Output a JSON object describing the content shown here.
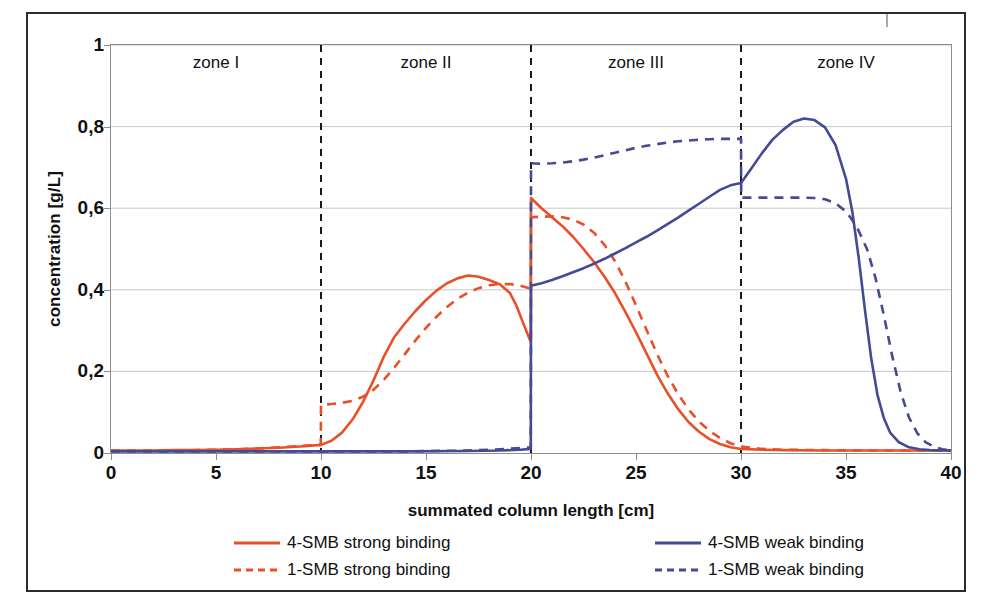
{
  "chart_data": {
    "type": "line",
    "title": "",
    "xlabel": "summated column length [cm]",
    "ylabel": "concentration [g/L]",
    "xlim": [
      0,
      40
    ],
    "ylim": [
      0,
      1
    ],
    "xticks": [
      "0",
      "5",
      "10",
      "15",
      "20",
      "25",
      "30",
      "35",
      "40"
    ],
    "xtick_values": [
      0,
      5,
      10,
      15,
      20,
      25,
      30,
      35,
      40
    ],
    "yticks": [
      "0",
      "0,2",
      "0,4",
      "0,6",
      "0,8",
      "1"
    ],
    "ytick_values": [
      0,
      0.2,
      0.4,
      0.6,
      0.8,
      1
    ],
    "grid": "horizontal",
    "legend_position": "below-axis",
    "zone_dividers": [
      10,
      20,
      30
    ],
    "zones": [
      {
        "label": "zone I",
        "start": 0,
        "end": 10
      },
      {
        "label": "zone II",
        "start": 10,
        "end": 20
      },
      {
        "label": "zone III",
        "start": 20,
        "end": 30
      },
      {
        "label": "zone IV",
        "start": 30,
        "end": 40
      }
    ],
    "colors": {
      "strong_binding": "#E8502A",
      "weak_binding": "#454A95",
      "zone_divider": "#1a1a1a",
      "grid": "#c9c9c9",
      "axis": "#8e8e8e",
      "frame": "#2b2b2b"
    },
    "series": [
      {
        "name": "4-SMB strong binding",
        "color": "#E8502A",
        "style": "solid",
        "points": [
          [
            0,
            0.006
          ],
          [
            1,
            0.006
          ],
          [
            2,
            0.006
          ],
          [
            3,
            0.007
          ],
          [
            4,
            0.007
          ],
          [
            5,
            0.008
          ],
          [
            6,
            0.009
          ],
          [
            7,
            0.011
          ],
          [
            8,
            0.013
          ],
          [
            9,
            0.016
          ],
          [
            9.99,
            0.02
          ],
          [
            10,
            0.02
          ],
          [
            10.5,
            0.03
          ],
          [
            11,
            0.05
          ],
          [
            11.5,
            0.082
          ],
          [
            12,
            0.125
          ],
          [
            12.5,
            0.178
          ],
          [
            13,
            0.237
          ],
          [
            13.5,
            0.285
          ],
          [
            14,
            0.318
          ],
          [
            14.5,
            0.348
          ],
          [
            15,
            0.375
          ],
          [
            15.5,
            0.398
          ],
          [
            16,
            0.416
          ],
          [
            16.5,
            0.428
          ],
          [
            17,
            0.435
          ],
          [
            17.5,
            0.432
          ],
          [
            18,
            0.424
          ],
          [
            18.5,
            0.414
          ],
          [
            19,
            0.392
          ],
          [
            19.3,
            0.362
          ],
          [
            19.6,
            0.322
          ],
          [
            19.85,
            0.29
          ],
          [
            19.99,
            0.272
          ],
          [
            20,
            0.625
          ],
          [
            20.5,
            0.6
          ],
          [
            21,
            0.578
          ],
          [
            21.5,
            0.556
          ],
          [
            22,
            0.53
          ],
          [
            22.5,
            0.5
          ],
          [
            23,
            0.468
          ],
          [
            23.5,
            0.432
          ],
          [
            24,
            0.392
          ],
          [
            24.5,
            0.345
          ],
          [
            25,
            0.296
          ],
          [
            25.5,
            0.244
          ],
          [
            26,
            0.192
          ],
          [
            26.5,
            0.147
          ],
          [
            27,
            0.108
          ],
          [
            27.5,
            0.076
          ],
          [
            28,
            0.052
          ],
          [
            28.5,
            0.034
          ],
          [
            29,
            0.022
          ],
          [
            29.5,
            0.014
          ],
          [
            30,
            0.01
          ],
          [
            31,
            0.008
          ],
          [
            32,
            0.007
          ],
          [
            34,
            0.006
          ],
          [
            36,
            0.006
          ],
          [
            38,
            0.006
          ],
          [
            40,
            0.006
          ]
        ]
      },
      {
        "name": "1-SMB strong binding",
        "color": "#E8502A",
        "style": "dashed",
        "points": [
          [
            0,
            0.006
          ],
          [
            2,
            0.006
          ],
          [
            4,
            0.007
          ],
          [
            6,
            0.009
          ],
          [
            7,
            0.011
          ],
          [
            8,
            0.014
          ],
          [
            9,
            0.017
          ],
          [
            9.99,
            0.02
          ],
          [
            10,
            0.118
          ],
          [
            10.5,
            0.12
          ],
          [
            11,
            0.123
          ],
          [
            11.5,
            0.128
          ],
          [
            12,
            0.138
          ],
          [
            12.5,
            0.155
          ],
          [
            13,
            0.18
          ],
          [
            13.5,
            0.21
          ],
          [
            14,
            0.243
          ],
          [
            14.5,
            0.276
          ],
          [
            15,
            0.307
          ],
          [
            15.5,
            0.334
          ],
          [
            16,
            0.358
          ],
          [
            16.5,
            0.378
          ],
          [
            17,
            0.393
          ],
          [
            17.5,
            0.404
          ],
          [
            18,
            0.411
          ],
          [
            18.5,
            0.414
          ],
          [
            19,
            0.414
          ],
          [
            19.5,
            0.41
          ],
          [
            19.99,
            0.403
          ],
          [
            20,
            0.578
          ],
          [
            20.5,
            0.579
          ],
          [
            21,
            0.58
          ],
          [
            21.5,
            0.578
          ],
          [
            22,
            0.572
          ],
          [
            22.5,
            0.56
          ],
          [
            23,
            0.54
          ],
          [
            23.5,
            0.51
          ],
          [
            24,
            0.47
          ],
          [
            24.5,
            0.42
          ],
          [
            25,
            0.362
          ],
          [
            25.5,
            0.302
          ],
          [
            26,
            0.243
          ],
          [
            26.5,
            0.19
          ],
          [
            27,
            0.145
          ],
          [
            27.5,
            0.107
          ],
          [
            28,
            0.077
          ],
          [
            28.5,
            0.054
          ],
          [
            29,
            0.037
          ],
          [
            29.5,
            0.024
          ],
          [
            30,
            0.016
          ],
          [
            31,
            0.01
          ],
          [
            32,
            0.008
          ],
          [
            34,
            0.007
          ],
          [
            36,
            0.006
          ],
          [
            38,
            0.006
          ],
          [
            40,
            0.006
          ]
        ]
      },
      {
        "name": "4-SMB weak binding",
        "color": "#454A95",
        "style": "solid",
        "points": [
          [
            0,
            0.004
          ],
          [
            5,
            0.004
          ],
          [
            10,
            0.004
          ],
          [
            14,
            0.004
          ],
          [
            17,
            0.005
          ],
          [
            18.5,
            0.006
          ],
          [
            19.5,
            0.008
          ],
          [
            19.99,
            0.01
          ],
          [
            20,
            0.41
          ],
          [
            20.5,
            0.416
          ],
          [
            21,
            0.424
          ],
          [
            21.5,
            0.433
          ],
          [
            22,
            0.443
          ],
          [
            22.5,
            0.453
          ],
          [
            23,
            0.464
          ],
          [
            23.5,
            0.476
          ],
          [
            24,
            0.489
          ],
          [
            24.5,
            0.502
          ],
          [
            25,
            0.516
          ],
          [
            25.5,
            0.53
          ],
          [
            26,
            0.545
          ],
          [
            26.5,
            0.561
          ],
          [
            27,
            0.577
          ],
          [
            27.5,
            0.594
          ],
          [
            28,
            0.611
          ],
          [
            28.5,
            0.628
          ],
          [
            29,
            0.645
          ],
          [
            29.5,
            0.656
          ],
          [
            30,
            0.662
          ],
          [
            30.5,
            0.698
          ],
          [
            31,
            0.735
          ],
          [
            31.5,
            0.768
          ],
          [
            32,
            0.792
          ],
          [
            32.5,
            0.812
          ],
          [
            33,
            0.82
          ],
          [
            33.5,
            0.816
          ],
          [
            34,
            0.798
          ],
          [
            34.5,
            0.755
          ],
          [
            35,
            0.672
          ],
          [
            35.3,
            0.592
          ],
          [
            35.6,
            0.48
          ],
          [
            35.9,
            0.352
          ],
          [
            36.2,
            0.232
          ],
          [
            36.5,
            0.142
          ],
          [
            36.8,
            0.086
          ],
          [
            37.1,
            0.05
          ],
          [
            37.5,
            0.027
          ],
          [
            38,
            0.014
          ],
          [
            38.5,
            0.009
          ],
          [
            39,
            0.007
          ],
          [
            40,
            0.006
          ]
        ]
      },
      {
        "name": "1-SMB weak binding",
        "color": "#454A95",
        "style": "dashed",
        "points": [
          [
            0,
            0.004
          ],
          [
            5,
            0.004
          ],
          [
            10,
            0.004
          ],
          [
            14,
            0.004
          ],
          [
            17,
            0.006
          ],
          [
            18.5,
            0.009
          ],
          [
            19.5,
            0.012
          ],
          [
            19.99,
            0.014
          ],
          [
            20,
            0.71
          ],
          [
            20.5,
            0.709
          ],
          [
            21,
            0.71
          ],
          [
            21.5,
            0.712
          ],
          [
            22,
            0.715
          ],
          [
            22.5,
            0.719
          ],
          [
            23,
            0.724
          ],
          [
            23.5,
            0.73
          ],
          [
            24,
            0.736
          ],
          [
            24.5,
            0.742
          ],
          [
            25,
            0.748
          ],
          [
            25.5,
            0.753
          ],
          [
            26,
            0.757
          ],
          [
            26.5,
            0.761
          ],
          [
            27,
            0.764
          ],
          [
            27.5,
            0.766
          ],
          [
            28,
            0.768
          ],
          [
            28.5,
            0.769
          ],
          [
            29,
            0.77
          ],
          [
            29.5,
            0.77
          ],
          [
            30,
            0.77
          ],
          [
            30.01,
            0.626
          ],
          [
            31,
            0.626
          ],
          [
            32,
            0.626
          ],
          [
            33,
            0.626
          ],
          [
            33.5,
            0.625
          ],
          [
            34,
            0.622
          ],
          [
            34.5,
            0.612
          ],
          [
            35,
            0.592
          ],
          [
            35.5,
            0.556
          ],
          [
            36,
            0.5
          ],
          [
            36.4,
            0.43
          ],
          [
            36.8,
            0.338
          ],
          [
            37.2,
            0.238
          ],
          [
            37.6,
            0.15
          ],
          [
            38,
            0.087
          ],
          [
            38.4,
            0.048
          ],
          [
            38.8,
            0.026
          ],
          [
            39.2,
            0.015
          ],
          [
            39.6,
            0.009
          ],
          [
            40,
            0.007
          ]
        ]
      }
    ],
    "annotations": [
      {
        "text": "zone I",
        "x": 5
      },
      {
        "text": "zone II",
        "x": 15
      },
      {
        "text": "zone III",
        "x": 25
      },
      {
        "text": "zone IV",
        "x": 35
      }
    ]
  },
  "legend": {
    "items": [
      {
        "label": "4-SMB strong binding",
        "color": "#E8502A",
        "style": "solid"
      },
      {
        "label": "4-SMB weak binding",
        "color": "#454A95",
        "style": "solid"
      },
      {
        "label": "1-SMB strong binding",
        "color": "#E8502A",
        "style": "dashed"
      },
      {
        "label": "1-SMB weak binding",
        "color": "#454A95",
        "style": "dashed"
      }
    ]
  }
}
